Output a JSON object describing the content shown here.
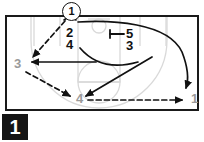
{
  "figure": {
    "number": "1",
    "type": "basketball-play-diagram",
    "caption": ""
  },
  "court": {
    "border_color": "#1a1a1a",
    "line_color": "#d8d8d8",
    "background": "#ffffff"
  },
  "colors": {
    "ink": "#111111",
    "grey_label": "#9a9a9a",
    "court_line": "#d8d8d8",
    "figure_box": "#151515",
    "figure_text": "#ffffff"
  },
  "players": [
    {
      "id": "p1-top",
      "label": "1",
      "style": "circled",
      "color": "#111111",
      "x": 70,
      "y": 10
    },
    {
      "id": "p2",
      "label": "2",
      "style": "plain",
      "color": "#111111",
      "x": 72,
      "y": 32
    },
    {
      "id": "p4-top",
      "label": "4",
      "style": "plain",
      "color": "#111111",
      "x": 72,
      "y": 44
    },
    {
      "id": "p5",
      "label": "5",
      "style": "plain",
      "color": "#111111",
      "x": 131,
      "y": 33
    },
    {
      "id": "p3-right",
      "label": "3",
      "style": "plain",
      "color": "#111111",
      "x": 131,
      "y": 45
    },
    {
      "id": "p3-left",
      "label": "3",
      "style": "plain",
      "color": "#9a9a9a",
      "x": 18,
      "y": 64
    },
    {
      "id": "p4-bottom",
      "label": "4",
      "style": "plain",
      "color": "#9a9a9a",
      "x": 79,
      "y": 98
    },
    {
      "id": "p1-right",
      "label": "1",
      "style": "plain",
      "color": "#9a9a9a",
      "x": 194,
      "y": 97
    }
  ],
  "screen_marker": {
    "name": "screen-symbol",
    "description": "T-bar screen indicator left of player 5",
    "x": 112,
    "y": 34
  },
  "movements": [
    {
      "id": "pass-1-to-3",
      "kind": "pass",
      "line": "dashed",
      "from": "1",
      "to": "3"
    },
    {
      "id": "pass-3-to-4",
      "kind": "pass",
      "line": "dashed",
      "from": "3",
      "to": "4"
    },
    {
      "id": "pass-4-to-1",
      "kind": "pass",
      "line": "dashed",
      "from": "4",
      "to": "1"
    },
    {
      "id": "cut-2-to-3",
      "kind": "cut",
      "line": "solid",
      "from": "2",
      "to": "3"
    },
    {
      "id": "cut-3-to-4",
      "kind": "cut",
      "line": "solid",
      "from": "3",
      "to": "4"
    },
    {
      "id": "cut-4-to-arc",
      "kind": "cut",
      "line": "solid",
      "from": "4",
      "to": "wing"
    },
    {
      "id": "cut-1-to-right",
      "kind": "cut",
      "line": "solid",
      "from": "1",
      "to": "1-right"
    }
  ]
}
